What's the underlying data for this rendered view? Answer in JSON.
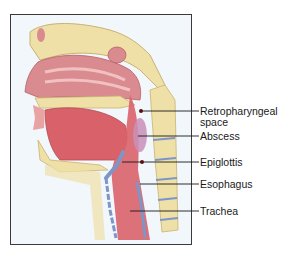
{
  "figure": {
    "type": "anatomical-illustration",
    "colors": {
      "frame_border": "#3a3a3a",
      "background": "#f1f7fb",
      "bone": "#efe0a8",
      "soft_tissue": "#d9747a",
      "mucosa": "#e8a3a3",
      "cartilage": "#7d96c7",
      "abscess": "#c98fb8",
      "leader_line": "#1a1a1a"
    },
    "labels": [
      {
        "id": "retropharyngeal-space",
        "text": "Retropharyngeal",
        "text2": "space"
      },
      {
        "id": "abscess",
        "text": "Abscess"
      },
      {
        "id": "epiglottis",
        "text": "Epiglottis"
      },
      {
        "id": "esophagus",
        "text": "Esophagus"
      },
      {
        "id": "trachea",
        "text": "Trachea"
      }
    ]
  }
}
